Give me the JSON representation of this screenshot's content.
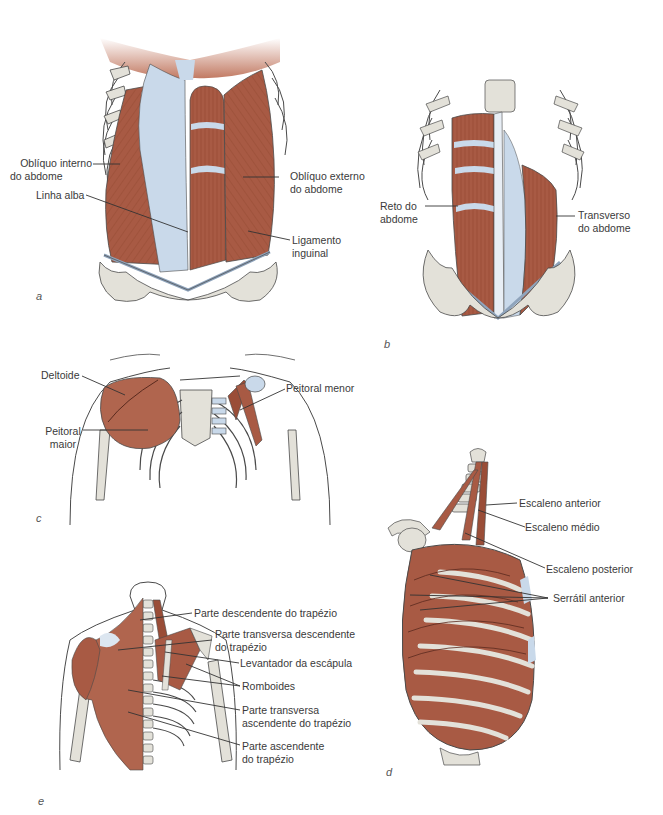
{
  "colors": {
    "muscle": "#a85a44",
    "muscle_dark": "#7d3b2b",
    "fascia": "#c9d9ea",
    "bone": "#e3e1d9",
    "bone_outline": "#4a4a4a",
    "leader_line": "#333333",
    "label_text": "#3a3a3a"
  },
  "panels": {
    "a": {
      "letter": "a",
      "labels": {
        "obliquo_interno_l1": "Oblíquo interno",
        "obliquo_interno_l2": "do abdome",
        "linha_alba": "Linha alba",
        "obliquo_externo_l1": "Oblíquo externo",
        "obliquo_externo_l2": "do abdome",
        "ligamento_l1": "Ligamento",
        "ligamento_l2": "inguinal"
      }
    },
    "b": {
      "letter": "b",
      "labels": {
        "reto_l1": "Reto do",
        "reto_l2": "abdome",
        "transverso_l1": "Transverso",
        "transverso_l2": "do abdome"
      }
    },
    "c": {
      "letter": "c",
      "labels": {
        "deltoide": "Deltoide",
        "peitoral_maior_l1": "Peitoral",
        "peitoral_maior_l2": "maior",
        "peitoral_menor": "Peitoral menor"
      }
    },
    "d": {
      "letter": "d",
      "labels": {
        "escaleno_anterior": "Escaleno anterior",
        "escaleno_medio": "Escaleno médio",
        "escaleno_posterior": "Escaleno posterior",
        "serratil_anterior": "Serrátil anterior"
      }
    },
    "e": {
      "letter": "e",
      "labels": {
        "parte_descendente": "Parte descendente do trapézio",
        "parte_transversa_desc_l1": "Parte transversa descendente",
        "parte_transversa_desc_l2": "do trapézio",
        "levantador": "Levantador da escápula",
        "romboides": "Romboides",
        "parte_transversa_asc_l1": "Parte transversa",
        "parte_transversa_asc_l2": "ascendente do trapézio",
        "parte_ascendente_l1": "Parte ascendente",
        "parte_ascendente_l2": "do trapézio"
      }
    }
  }
}
